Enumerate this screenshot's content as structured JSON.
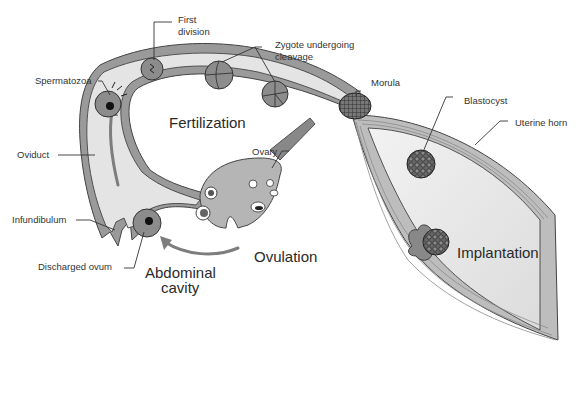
{
  "diagram": {
    "labels": {
      "spermatozoa": "Spermatozoa",
      "first_division_line1": "First",
      "first_division_line2": "division",
      "zygote_line1": "Zygote undergoing",
      "zygote_line2": "cleavage",
      "morula": "Morula",
      "blastocyst": "Blastocyst",
      "uterine_horn": "Uterine horn",
      "oviduct": "Oviduct",
      "ovary": "Ovary",
      "infundibulum": "Infundibulum",
      "discharged_ovum": "Discharged ovum"
    },
    "process_labels": {
      "fertilization": "Fertilization",
      "ovulation": "Ovulation",
      "abdominal_line1": "Abdominal",
      "abdominal_line2": "cavity",
      "implantation": "Implantation"
    },
    "colors": {
      "background": "#ffffff",
      "tube_wall": "#9a9a9a",
      "lumen": "#e4e4e4",
      "muscle": "#bdbdbd",
      "cell": "#8c8c8c",
      "text": "#333333"
    }
  }
}
